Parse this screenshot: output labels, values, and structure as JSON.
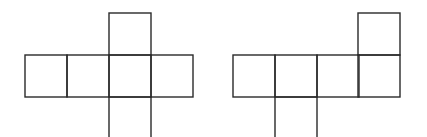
{
  "diagram": {
    "stroke_color": "#2a2a2a",
    "background": "#ffffff",
    "unit_px": 42,
    "figures": [
      {
        "name": "net-left",
        "squares": [
          {
            "x": 25,
            "y": 55
          },
          {
            "x": 67,
            "y": 55
          },
          {
            "x": 109,
            "y": 55
          },
          {
            "x": 151,
            "y": 55
          },
          {
            "x": 109,
            "y": 13
          },
          {
            "x": 109,
            "y": 97
          }
        ]
      },
      {
        "name": "net-right",
        "squares": [
          {
            "x": 233,
            "y": 55
          },
          {
            "x": 275,
            "y": 55
          },
          {
            "x": 317,
            "y": 55
          },
          {
            "x": 358,
            "y": 55
          },
          {
            "x": 358,
            "y": 13
          },
          {
            "x": 275,
            "y": 97
          }
        ]
      }
    ]
  }
}
